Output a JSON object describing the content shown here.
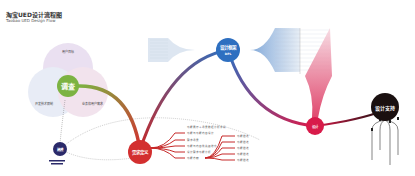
{
  "header": {
    "title": "淘宝UED设计流程图",
    "subtitle": "Taobao UED Design Flow"
  },
  "colors": {
    "research": "#7cb342",
    "define": "#d32f2f",
    "framework": "#2e6fc0",
    "design": "#d81b4a",
    "support": "#1a1010",
    "model": "#2b2a6a"
  },
  "nodes": {
    "research": {
      "label": "调查"
    },
    "model": {
      "label": "建模"
    },
    "define": {
      "label": "需求定义"
    },
    "framework": {
      "label": "设计框架",
      "sub": "DPL"
    },
    "design": {
      "label": "设计"
    },
    "support": {
      "label": "设计支持"
    }
  },
  "venn": {
    "top": "用户目标",
    "left": "开发技术限制",
    "right": "业务和用户需求"
  },
  "define_branches": {
    "header": "功能展示＋场景数据分析字段",
    "items": [
      "功能与功能内容设计",
      "需求场景",
      "功能与内容优先级排序",
      "设计需求功能分析",
      "功能方案"
    ],
    "sub_items": [
      "功能描述",
      "功能描述",
      "功能描述",
      "功能描述",
      "功能描述"
    ]
  }
}
